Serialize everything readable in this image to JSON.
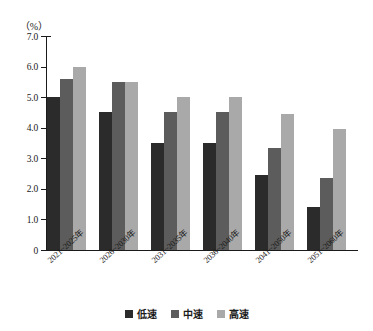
{
  "chart_data": {
    "type": "bar",
    "title": "",
    "subtitle": "",
    "unit_label": "（%）",
    "xlabel": "",
    "ylabel": "",
    "ylim": [
      0,
      7.0
    ],
    "grid": false,
    "legend_position": "bottom-center",
    "categories": [
      "2021~2025年",
      "2026~2030年",
      "2031~2035年",
      "2036~2040年",
      "2041~2050年",
      "2051~2060年"
    ],
    "ytick_labels": [
      "0",
      "1.0",
      "2.0",
      "3.0",
      "4.0",
      "5.0",
      "6.0",
      "7.0"
    ],
    "ytick_values": [
      0,
      1.0,
      2.0,
      3.0,
      4.0,
      5.0,
      6.0,
      7.0
    ],
    "series": [
      {
        "name": "低速",
        "color": "#2b2b2b",
        "values": [
          5.0,
          4.5,
          3.5,
          3.5,
          2.45,
          1.4
        ]
      },
      {
        "name": "中速",
        "color": "#5c5c5c",
        "values": [
          5.6,
          5.5,
          4.5,
          4.5,
          3.35,
          2.35
        ]
      },
      {
        "name": "高速",
        "color": "#a9a9a9",
        "values": [
          6.0,
          5.5,
          5.0,
          5.0,
          4.45,
          3.95
        ]
      }
    ]
  },
  "legend": {
    "items": [
      {
        "label": "低速"
      },
      {
        "label": "中速"
      },
      {
        "label": "高速"
      }
    ]
  },
  "colors": {
    "series_low": "#2b2b2b",
    "series_mid": "#5c5c5c",
    "series_high": "#a9a9a9",
    "axis": "#1a1a1a",
    "background": "#ffffff"
  }
}
